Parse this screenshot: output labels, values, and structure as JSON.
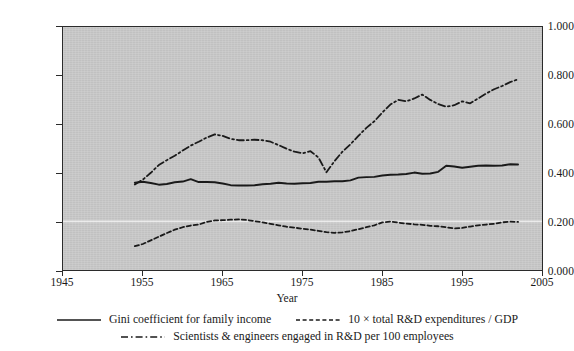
{
  "chart_data": {
    "type": "line",
    "title": "",
    "xlabel": "Year",
    "ylabel": "",
    "xlim": [
      1945,
      2005
    ],
    "ylim": [
      0.0,
      1.0
    ],
    "xticks": [
      "1945",
      "1955",
      "1965",
      "1975",
      "1985",
      "1995",
      "2005"
    ],
    "yticks": [
      "0.000",
      "0.200",
      "0.400",
      "0.600",
      "0.800",
      "1.000"
    ],
    "grid": "single faint white horizontal gridline at y = 0.200",
    "legend_position": "below axes, centered, two rows",
    "series": [
      {
        "name": "Gini coefficient for family income",
        "style": "solid",
        "color": "#1a1a1a",
        "x": [
          1954,
          1955,
          1956,
          1957,
          1958,
          1959,
          1960,
          1961,
          1962,
          1963,
          1964,
          1965,
          1966,
          1967,
          1968,
          1969,
          1970,
          1971,
          1972,
          1973,
          1974,
          1975,
          1976,
          1977,
          1978,
          1979,
          1980,
          1981,
          1982,
          1983,
          1984,
          1985,
          1986,
          1987,
          1988,
          1989,
          1990,
          1991,
          1992,
          1993,
          1994,
          1995,
          1996,
          1997,
          1998,
          1999,
          2000,
          2001,
          2002
        ],
        "values": [
          0.359,
          0.363,
          0.358,
          0.351,
          0.354,
          0.361,
          0.364,
          0.374,
          0.362,
          0.362,
          0.361,
          0.356,
          0.349,
          0.348,
          0.348,
          0.349,
          0.353,
          0.355,
          0.359,
          0.356,
          0.355,
          0.357,
          0.358,
          0.363,
          0.363,
          0.365,
          0.365,
          0.369,
          0.38,
          0.382,
          0.383,
          0.389,
          0.392,
          0.393,
          0.395,
          0.401,
          0.396,
          0.397,
          0.404,
          0.429,
          0.426,
          0.421,
          0.425,
          0.429,
          0.43,
          0.429,
          0.43,
          0.435,
          0.434
        ]
      },
      {
        "name": "10 × total R&D expenditures / GDP",
        "style": "dashed",
        "color": "#1a1a1a",
        "x": [
          1954,
          1955,
          1956,
          1957,
          1958,
          1959,
          1960,
          1961,
          1962,
          1963,
          1964,
          1965,
          1966,
          1967,
          1968,
          1969,
          1970,
          1971,
          1972,
          1973,
          1974,
          1975,
          1976,
          1977,
          1978,
          1979,
          1980,
          1981,
          1982,
          1983,
          1984,
          1985,
          1986,
          1987,
          1988,
          1989,
          1990,
          1991,
          1992,
          1993,
          1994,
          1995,
          1996,
          1997,
          1998,
          1999,
          2000,
          2001,
          2002
        ],
        "values": [
          0.098,
          0.107,
          0.122,
          0.137,
          0.152,
          0.166,
          0.176,
          0.183,
          0.187,
          0.198,
          0.204,
          0.205,
          0.207,
          0.208,
          0.206,
          0.201,
          0.196,
          0.19,
          0.184,
          0.178,
          0.174,
          0.17,
          0.166,
          0.161,
          0.156,
          0.153,
          0.155,
          0.16,
          0.168,
          0.176,
          0.184,
          0.196,
          0.199,
          0.195,
          0.191,
          0.188,
          0.186,
          0.182,
          0.18,
          0.176,
          0.171,
          0.173,
          0.179,
          0.184,
          0.187,
          0.19,
          0.196,
          0.199,
          0.198
        ]
      },
      {
        "name": "Scientists & engineers engaged in R&D per 100 employees",
        "style": "dash-dot",
        "color": "#1a1a1a",
        "x": [
          1954,
          1955,
          1956,
          1957,
          1958,
          1959,
          1960,
          1961,
          1962,
          1963,
          1964,
          1965,
          1966,
          1967,
          1968,
          1969,
          1970,
          1971,
          1972,
          1973,
          1974,
          1975,
          1976,
          1977,
          1978,
          1979,
          1980,
          1981,
          1982,
          1983,
          1984,
          1985,
          1986,
          1987,
          1988,
          1989,
          1990,
          1991,
          1992,
          1993,
          1994,
          1995,
          1996,
          1997,
          1998,
          1999,
          2000,
          2001,
          2002
        ],
        "values": [
          0.352,
          0.372,
          0.4,
          0.432,
          0.452,
          0.47,
          0.492,
          0.512,
          0.528,
          0.545,
          0.558,
          0.552,
          0.54,
          0.534,
          0.534,
          0.536,
          0.534,
          0.528,
          0.514,
          0.499,
          0.487,
          0.48,
          0.489,
          0.463,
          0.402,
          0.448,
          0.487,
          0.517,
          0.552,
          0.585,
          0.612,
          0.648,
          0.681,
          0.7,
          0.694,
          0.706,
          0.722,
          0.7,
          0.683,
          0.672,
          0.678,
          0.694,
          0.686,
          0.706,
          0.726,
          0.744,
          0.757,
          0.773,
          0.785
        ]
      }
    ]
  },
  "axes": {
    "x_title": "Year",
    "x_tick_labels": [
      "1945",
      "1955",
      "1965",
      "1975",
      "1985",
      "1995",
      "2005"
    ],
    "y_tick_labels": [
      "0.000",
      "0.200",
      "0.400",
      "0.600",
      "0.800",
      "1.000"
    ]
  },
  "legend": {
    "row1": [
      {
        "label": "Gini coefficient for family income",
        "style": "solid"
      },
      {
        "label": "10 × total R&D expenditures / GDP",
        "style": "dashed"
      }
    ],
    "row2": [
      {
        "label": "Scientists & engineers engaged in R&D per 100 employees",
        "style": "dash-dot"
      }
    ]
  },
  "colors": {
    "plot_background": "#c9c9c9",
    "page_background": "#ffffff",
    "ink": "#1a1a1a",
    "gridline": "#f2f2f2"
  }
}
